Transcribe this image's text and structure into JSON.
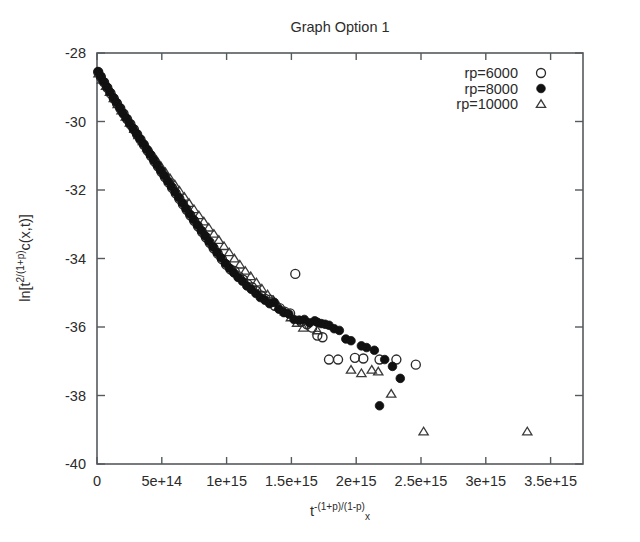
{
  "chart_data": {
    "type": "scatter",
    "title": "Graph  Option 1",
    "xlabel": "t^-(1+p)/(1-p) x",
    "xlabel_parts": {
      "base": "t",
      "exponent": "-(1+p)/(1-p)",
      "subscript": "x"
    },
    "ylabel": "ln[t^2/(1+p) c(x,t)]",
    "ylabel_parts": {
      "prefix": "ln[t",
      "exponent": "2/(1+p)",
      "suffix": "c(x,t)]"
    },
    "xlim": [
      0,
      3750000000000000
    ],
    "ylim": [
      -40,
      -28
    ],
    "grid": false,
    "legend_position": "top-right",
    "xticks": [
      0,
      500000000000000,
      1000000000000000,
      1500000000000000,
      2000000000000000,
      2500000000000000,
      3000000000000000,
      3500000000000000
    ],
    "xtick_labels": [
      "0",
      "5e+14",
      "1e+15",
      "1.5e+15",
      "2e+15",
      "2.5e+15",
      "3e+15",
      "3.5e+15"
    ],
    "yticks": [
      -40,
      -38,
      -36,
      -34,
      -32,
      -30,
      -28
    ],
    "ytick_labels": [
      "-40",
      "-38",
      "-36",
      "-34",
      "-32",
      "-30",
      "-28"
    ],
    "series": [
      {
        "name": "rp=6000",
        "marker": "open-circle",
        "color": "#2a2a2a",
        "points": [
          [
            10000000000000,
            -28.56
          ],
          [
            30000000000000,
            -28.7
          ],
          [
            55000000000000,
            -28.86
          ],
          [
            80000000000000,
            -29.02
          ],
          [
            105000000000000,
            -29.18
          ],
          [
            130000000000000,
            -29.33
          ],
          [
            155000000000000,
            -29.48
          ],
          [
            180000000000000,
            -29.62
          ],
          [
            205000000000000,
            -29.77
          ],
          [
            232000000000000,
            -29.93
          ],
          [
            258000000000000,
            -30.08
          ],
          [
            285000000000000,
            -30.23
          ],
          [
            310000000000000,
            -30.38
          ],
          [
            336000000000000,
            -30.53
          ],
          [
            362000000000000,
            -30.68
          ],
          [
            390000000000000,
            -30.85
          ],
          [
            416000000000000,
            -31.0
          ],
          [
            443000000000000,
            -31.16
          ],
          [
            470000000000000,
            -31.31
          ],
          [
            497000000000000,
            -31.47
          ],
          [
            524000000000000,
            -31.62
          ],
          [
            552000000000000,
            -31.78
          ],
          [
            580000000000000,
            -31.94
          ],
          [
            608000000000000,
            -32.1
          ],
          [
            636000000000000,
            -32.26
          ],
          [
            664000000000000,
            -32.42
          ],
          [
            692000000000000,
            -32.58
          ],
          [
            720000000000000,
            -32.74
          ],
          [
            750000000000000,
            -32.9
          ],
          [
            780000000000000,
            -33.06
          ],
          [
            810000000000000,
            -33.22
          ],
          [
            840000000000000,
            -33.38
          ],
          [
            870000000000000,
            -33.54
          ],
          [
            900000000000000,
            -33.7
          ],
          [
            932000000000000,
            -33.86
          ],
          [
            964000000000000,
            -34.02
          ],
          [
            996000000000000,
            -34.18
          ],
          [
            1030000000000000,
            -34.32
          ],
          [
            1062000000000000,
            -34.36
          ],
          [
            1095000000000000,
            -34.52
          ],
          [
            1128000000000000,
            -34.62
          ],
          [
            1162000000000000,
            -34.75
          ],
          [
            1196000000000000,
            -34.84
          ],
          [
            1230000000000000,
            -34.95
          ],
          [
            1266000000000000,
            -35.08
          ],
          [
            1300000000000000,
            -35.18
          ],
          [
            1336000000000000,
            -35.2
          ],
          [
            1372000000000000,
            -35.38
          ],
          [
            1410000000000000,
            -35.45
          ],
          [
            1448000000000000,
            -35.55
          ],
          [
            1490000000000000,
            -35.6
          ],
          [
            1530000000000000,
            -34.45
          ],
          [
            1575000000000000,
            -35.85
          ],
          [
            1620000000000000,
            -35.92
          ],
          [
            1660000000000000,
            -36.02
          ],
          [
            1700000000000000,
            -36.25
          ],
          [
            1740000000000000,
            -36.3
          ],
          [
            1790000000000000,
            -36.95
          ],
          [
            1860000000000000,
            -36.95
          ],
          [
            1990000000000000,
            -36.9
          ],
          [
            2055000000000000,
            -36.92
          ],
          [
            2180000000000000,
            -36.95
          ],
          [
            2310000000000000,
            -36.95
          ],
          [
            2460000000000000,
            -37.1
          ]
        ]
      },
      {
        "name": "rp=8000",
        "marker": "filled-circle",
        "color": "#111111",
        "points": [
          [
            8000000000000,
            -28.54
          ],
          [
            28000000000000,
            -28.68
          ],
          [
            52000000000000,
            -28.84
          ],
          [
            76000000000000,
            -28.99
          ],
          [
            100000000000000,
            -29.14
          ],
          [
            126000000000000,
            -29.3
          ],
          [
            150000000000000,
            -29.44
          ],
          [
            176000000000000,
            -29.6
          ],
          [
            200000000000000,
            -29.75
          ],
          [
            226000000000000,
            -29.9
          ],
          [
            252000000000000,
            -30.05
          ],
          [
            278000000000000,
            -30.2
          ],
          [
            304000000000000,
            -30.35
          ],
          [
            330000000000000,
            -30.5
          ],
          [
            357000000000000,
            -30.65
          ],
          [
            384000000000000,
            -30.81
          ],
          [
            410000000000000,
            -30.96
          ],
          [
            437000000000000,
            -31.12
          ],
          [
            464000000000000,
            -31.27
          ],
          [
            491000000000000,
            -31.43
          ],
          [
            518000000000000,
            -31.58
          ],
          [
            546000000000000,
            -31.74
          ],
          [
            574000000000000,
            -31.9
          ],
          [
            602000000000000,
            -32.06
          ],
          [
            630000000000000,
            -32.22
          ],
          [
            658000000000000,
            -32.38
          ],
          [
            686000000000000,
            -32.54
          ],
          [
            715000000000000,
            -32.7
          ],
          [
            744000000000000,
            -32.86
          ],
          [
            774000000000000,
            -33.02
          ],
          [
            804000000000000,
            -33.18
          ],
          [
            834000000000000,
            -33.34
          ],
          [
            864000000000000,
            -33.5
          ],
          [
            895000000000000,
            -33.66
          ],
          [
            926000000000000,
            -33.82
          ],
          [
            957000000000000,
            -33.98
          ],
          [
            990000000000000,
            -34.14
          ],
          [
            1022000000000000,
            -34.28
          ],
          [
            1056000000000000,
            -34.42
          ],
          [
            1088000000000000,
            -34.55
          ],
          [
            1122000000000000,
            -34.66
          ],
          [
            1156000000000000,
            -34.8
          ],
          [
            1190000000000000,
            -34.9
          ],
          [
            1226000000000000,
            -35.02
          ],
          [
            1260000000000000,
            -35.14
          ],
          [
            1296000000000000,
            -35.22
          ],
          [
            1332000000000000,
            -35.32
          ],
          [
            1368000000000000,
            -35.28
          ],
          [
            1404000000000000,
            -35.48
          ],
          [
            1442000000000000,
            -35.58
          ],
          [
            1480000000000000,
            -35.62
          ],
          [
            1520000000000000,
            -35.78
          ],
          [
            1560000000000000,
            -35.8
          ],
          [
            1600000000000000,
            -35.78
          ],
          [
            1640000000000000,
            -35.88
          ],
          [
            1680000000000000,
            -35.82
          ],
          [
            1700000000000000,
            -35.86
          ],
          [
            1730000000000000,
            -35.9
          ],
          [
            1760000000000000,
            -35.92
          ],
          [
            1790000000000000,
            -35.95
          ],
          [
            1830000000000000,
            -36.05
          ],
          [
            1870000000000000,
            -36.1
          ],
          [
            1920000000000000,
            -36.35
          ],
          [
            1960000000000000,
            -36.4
          ],
          [
            2040000000000000,
            -36.55
          ],
          [
            2080000000000000,
            -36.6
          ],
          [
            2140000000000000,
            -36.68
          ],
          [
            2180000000000000,
            -38.3
          ],
          [
            2220000000000000,
            -36.95
          ],
          [
            2280000000000000,
            -37.15
          ],
          [
            2340000000000000,
            -37.5
          ]
        ]
      },
      {
        "name": "rp=10000",
        "marker": "open-triangle",
        "color": "#3a3a3a",
        "points": [
          [
            12000000000000,
            -28.6
          ],
          [
            40000000000000,
            -28.78
          ],
          [
            70000000000000,
            -28.96
          ],
          [
            100000000000000,
            -29.14
          ],
          [
            130000000000000,
            -29.32
          ],
          [
            160000000000000,
            -29.5
          ],
          [
            190000000000000,
            -29.68
          ],
          [
            222000000000000,
            -29.86
          ],
          [
            254000000000000,
            -30.04
          ],
          [
            288000000000000,
            -30.22
          ],
          [
            320000000000000,
            -30.4
          ],
          [
            354000000000000,
            -30.58
          ],
          [
            388000000000000,
            -30.76
          ],
          [
            422000000000000,
            -30.94
          ],
          [
            458000000000000,
            -31.12
          ],
          [
            492000000000000,
            -31.3
          ],
          [
            528000000000000,
            -31.48
          ],
          [
            564000000000000,
            -31.66
          ],
          [
            600000000000000,
            -31.84
          ],
          [
            636000000000000,
            -32.02
          ],
          [
            674000000000000,
            -32.2
          ],
          [
            710000000000000,
            -32.38
          ],
          [
            748000000000000,
            -32.56
          ],
          [
            786000000000000,
            -32.74
          ],
          [
            824000000000000,
            -32.92
          ],
          [
            862000000000000,
            -33.1
          ],
          [
            902000000000000,
            -33.28
          ],
          [
            940000000000000,
            -33.46
          ],
          [
            980000000000000,
            -33.64
          ],
          [
            1020000000000000,
            -33.82
          ],
          [
            1060000000000000,
            -34.0
          ],
          [
            1102000000000000,
            -34.18
          ],
          [
            1144000000000000,
            -34.36
          ],
          [
            1186000000000000,
            -34.52
          ],
          [
            1230000000000000,
            -34.7
          ],
          [
            1272000000000000,
            -34.88
          ],
          [
            1316000000000000,
            -35.05
          ],
          [
            1360000000000000,
            -35.22
          ],
          [
            1404000000000000,
            -35.4
          ],
          [
            1450000000000000,
            -35.55
          ],
          [
            1496000000000000,
            -35.72
          ],
          [
            1544000000000000,
            -35.88
          ],
          [
            1592000000000000,
            -36.02
          ],
          [
            1700000000000000,
            -36.1
          ],
          [
            1960000000000000,
            -37.25
          ],
          [
            2040000000000000,
            -37.35
          ],
          [
            2120000000000000,
            -37.25
          ],
          [
            2170000000000000,
            -37.3
          ],
          [
            2270000000000000,
            -37.95
          ],
          [
            2520000000000000,
            -39.05
          ],
          [
            3320000000000000,
            -39.05
          ]
        ]
      }
    ]
  },
  "legend": {
    "entries": [
      {
        "label": "rp=6000",
        "marker": "open-circle"
      },
      {
        "label": "rp=8000",
        "marker": "filled-circle"
      },
      {
        "label": "rp=10000",
        "marker": "open-triangle"
      }
    ]
  }
}
